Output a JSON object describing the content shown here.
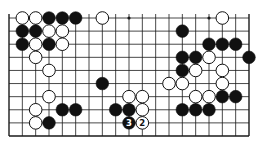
{
  "diagram": {
    "type": "go-board-fragment",
    "columns": 19,
    "rows_visible": 10,
    "bottom_edge_visible": true,
    "left_edge_visible": true,
    "right_edge_visible": true,
    "top_edge_visible": false,
    "colors": {
      "line": "#1a1a1a",
      "black_stone": "#111111",
      "white_stone": "#ffffff",
      "background": "#ffffff"
    },
    "hoshi": [
      {
        "row": 0,
        "col": 9
      },
      {
        "row": 0,
        "col": 15
      }
    ],
    "stones": [
      {
        "row": 0,
        "col": 1,
        "color": "white"
      },
      {
        "row": 0,
        "col": 2,
        "color": "white"
      },
      {
        "row": 0,
        "col": 3,
        "color": "black"
      },
      {
        "row": 0,
        "col": 4,
        "color": "black"
      },
      {
        "row": 0,
        "col": 5,
        "color": "black"
      },
      {
        "row": 0,
        "col": 7,
        "color": "white"
      },
      {
        "row": 0,
        "col": 16,
        "color": "white"
      },
      {
        "row": 1,
        "col": 1,
        "color": "black"
      },
      {
        "row": 1,
        "col": 2,
        "color": "black"
      },
      {
        "row": 1,
        "col": 3,
        "color": "white"
      },
      {
        "row": 1,
        "col": 4,
        "color": "white"
      },
      {
        "row": 1,
        "col": 13,
        "color": "black"
      },
      {
        "row": 2,
        "col": 1,
        "color": "black"
      },
      {
        "row": 2,
        "col": 2,
        "color": "white"
      },
      {
        "row": 2,
        "col": 3,
        "color": "black"
      },
      {
        "row": 2,
        "col": 4,
        "color": "white"
      },
      {
        "row": 2,
        "col": 15,
        "color": "black"
      },
      {
        "row": 2,
        "col": 16,
        "color": "black"
      },
      {
        "row": 2,
        "col": 17,
        "color": "black"
      },
      {
        "row": 3,
        "col": 2,
        "color": "white"
      },
      {
        "row": 3,
        "col": 13,
        "color": "black"
      },
      {
        "row": 3,
        "col": 14,
        "color": "black"
      },
      {
        "row": 3,
        "col": 15,
        "color": "white"
      },
      {
        "row": 3,
        "col": 18,
        "color": "black"
      },
      {
        "row": 4,
        "col": 3,
        "color": "white"
      },
      {
        "row": 4,
        "col": 13,
        "color": "black"
      },
      {
        "row": 4,
        "col": 14,
        "color": "white"
      },
      {
        "row": 4,
        "col": 16,
        "color": "white"
      },
      {
        "row": 5,
        "col": 7,
        "color": "black"
      },
      {
        "row": 5,
        "col": 12,
        "color": "white"
      },
      {
        "row": 5,
        "col": 13,
        "color": "white"
      },
      {
        "row": 5,
        "col": 16,
        "color": "white"
      },
      {
        "row": 6,
        "col": 3,
        "color": "white"
      },
      {
        "row": 6,
        "col": 9,
        "color": "white"
      },
      {
        "row": 6,
        "col": 10,
        "color": "white"
      },
      {
        "row": 6,
        "col": 14,
        "color": "white"
      },
      {
        "row": 6,
        "col": 15,
        "color": "white"
      },
      {
        "row": 6,
        "col": 16,
        "color": "black"
      },
      {
        "row": 6,
        "col": 17,
        "color": "black"
      },
      {
        "row": 7,
        "col": 2,
        "color": "white"
      },
      {
        "row": 7,
        "col": 4,
        "color": "black"
      },
      {
        "row": 7,
        "col": 5,
        "color": "black"
      },
      {
        "row": 7,
        "col": 8,
        "color": "black"
      },
      {
        "row": 7,
        "col": 9,
        "color": "black"
      },
      {
        "row": 7,
        "col": 10,
        "color": "white"
      },
      {
        "row": 7,
        "col": 13,
        "color": "black"
      },
      {
        "row": 7,
        "col": 14,
        "color": "black"
      },
      {
        "row": 7,
        "col": 15,
        "color": "black"
      },
      {
        "row": 8,
        "col": 2,
        "color": "white"
      },
      {
        "row": 8,
        "col": 3,
        "color": "black"
      },
      {
        "row": 8,
        "col": 9,
        "color": "black",
        "label": "3"
      },
      {
        "row": 8,
        "col": 10,
        "color": "white",
        "label": "2"
      }
    ]
  }
}
